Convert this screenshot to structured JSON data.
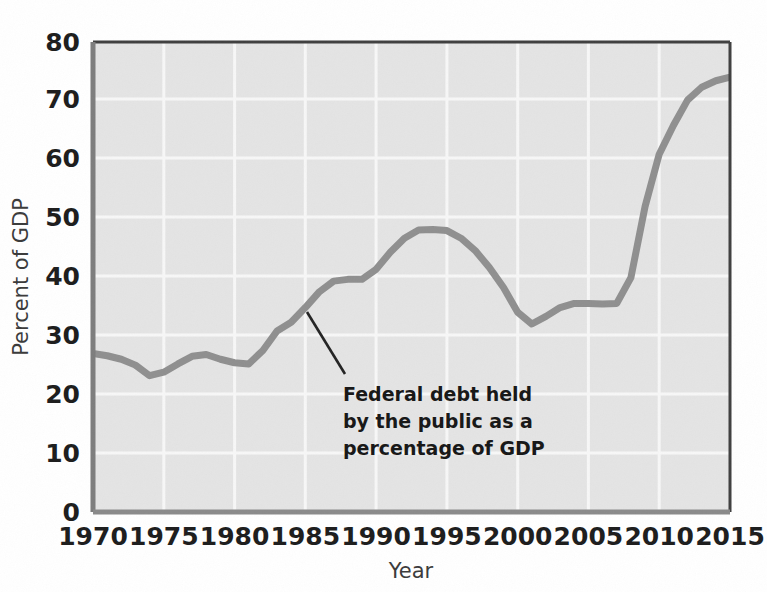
{
  "chart_data": {
    "type": "line",
    "title": "",
    "subtitle": "",
    "xlabel": "Year",
    "ylabel": "Percent of GDP",
    "xlim": [
      1970,
      2015
    ],
    "ylim": [
      0,
      80
    ],
    "grid": true,
    "legend_position": "none",
    "xticks": [
      "1970",
      "1975",
      "1980",
      "1985",
      "1990",
      "1995",
      "2000",
      "2005",
      "2010",
      "2015"
    ],
    "yticks": [
      "0",
      "10",
      "20",
      "30",
      "40",
      "50",
      "60",
      "70",
      "80"
    ],
    "annotations": [
      {
        "name": "series-callout",
        "lines": [
          "Federal debt held",
          "by the public as a",
          "percentage of GDP"
        ],
        "text": "Federal debt held by the public as a percentage of GDP",
        "points_to_year": 1986,
        "points_to_value": 36
      }
    ],
    "series": [
      {
        "name": "Federal debt held by the public as a percentage of GDP",
        "color": "#8f8f8f",
        "x": [
          1970,
          1971,
          1972,
          1973,
          1974,
          1975,
          1976,
          1977,
          1978,
          1979,
          1980,
          1981,
          1982,
          1983,
          1984,
          1985,
          1986,
          1987,
          1988,
          1989,
          1990,
          1991,
          1992,
          1993,
          1994,
          1995,
          1996,
          1997,
          1998,
          1999,
          2000,
          2001,
          2002,
          2003,
          2004,
          2005,
          2006,
          2007,
          2008,
          2009,
          2010,
          2011,
          2012,
          2013,
          2014,
          2015
        ],
        "values": [
          27.0,
          26.6,
          26.0,
          25.0,
          23.2,
          23.8,
          25.2,
          26.5,
          26.8,
          26.0,
          25.4,
          25.2,
          27.5,
          30.8,
          32.3,
          34.8,
          37.5,
          39.3,
          39.6,
          39.6,
          41.3,
          44.2,
          46.6,
          48.0,
          48.1,
          47.9,
          46.6,
          44.5,
          41.6,
          38.2,
          34.0,
          32.0,
          33.3,
          34.8,
          35.5,
          35.5,
          35.4,
          35.5,
          39.9,
          52.0,
          60.9,
          65.8,
          70.1,
          72.3,
          73.4,
          74.0
        ]
      }
    ]
  },
  "figure": {
    "plot_background": "#e4e4e4",
    "page_background": "#ffffff",
    "grid_color": "#f7f7f7",
    "axis_color": "#3f3f3f",
    "line_color": "#8f8f8f",
    "leader_color": "#232323"
  }
}
